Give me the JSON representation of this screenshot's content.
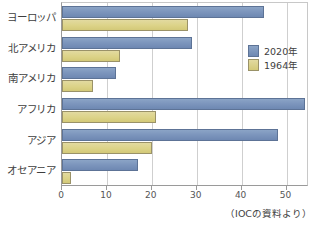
{
  "chart_data": {
    "type": "bar",
    "orientation": "horizontal",
    "title": "",
    "subtitle": "",
    "xlabel": "",
    "ylabel": "",
    "categories": [
      "ヨーロッパ",
      "北アメリカ",
      "南アメリカ",
      "アフリカ",
      "アジア",
      "オセアニア"
    ],
    "series": [
      {
        "name": "2020年",
        "color": "#7d96bd",
        "values": [
          45,
          29,
          12,
          54,
          48,
          17
        ]
      },
      {
        "name": "1964年",
        "color": "#dcd388",
        "values": [
          28,
          13,
          7,
          21,
          20,
          2
        ]
      }
    ],
    "xlim": [
      0,
      55
    ],
    "xticks": [
      0,
      10,
      20,
      30,
      40,
      50
    ],
    "xtick_labels": [
      "0",
      "10",
      "20",
      "30",
      "40",
      "50"
    ],
    "grid": true,
    "grid_axis": "x",
    "legend_position": "right-upper"
  },
  "legend": {
    "items": [
      {
        "label": "2020年",
        "color": "#7d96bd"
      },
      {
        "label": "1964年",
        "color": "#dcd388"
      }
    ]
  },
  "source_note": "（IOCの資料より）"
}
